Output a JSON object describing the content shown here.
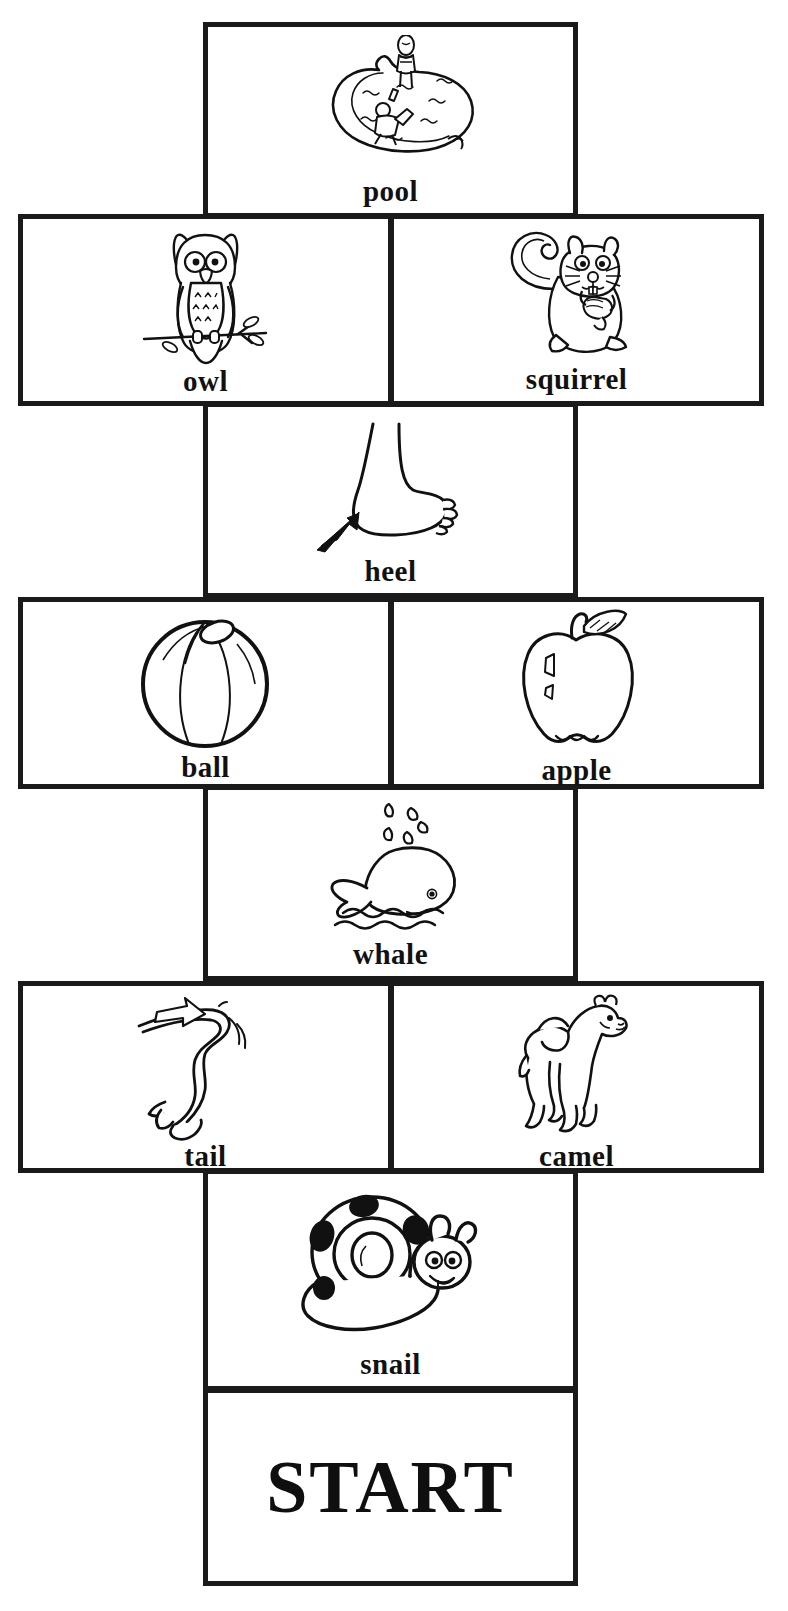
{
  "document": {
    "type": "board-game-path",
    "title_cut_off_top": "",
    "start_label": "START"
  },
  "path": {
    "direction": "bottom-to-top",
    "rows": [
      {
        "row_index": 0,
        "kind": "narrow",
        "cells": [
          {
            "label": "pool",
            "icon": "pool-icon"
          }
        ]
      },
      {
        "row_index": 1,
        "kind": "wide",
        "cells": [
          {
            "label": "owl",
            "icon": "owl-icon"
          },
          {
            "label": "squirrel",
            "icon": "squirrel-icon"
          }
        ]
      },
      {
        "row_index": 2,
        "kind": "narrow",
        "cells": [
          {
            "label": "heel",
            "icon": "heel-icon"
          }
        ]
      },
      {
        "row_index": 3,
        "kind": "wide",
        "cells": [
          {
            "label": "ball",
            "icon": "ball-icon"
          },
          {
            "label": "apple",
            "icon": "apple-icon"
          }
        ]
      },
      {
        "row_index": 4,
        "kind": "narrow",
        "cells": [
          {
            "label": "whale",
            "icon": "whale-icon"
          }
        ]
      },
      {
        "row_index": 5,
        "kind": "wide",
        "cells": [
          {
            "label": "tail",
            "icon": "tail-icon"
          },
          {
            "label": "camel",
            "icon": "camel-icon"
          }
        ]
      },
      {
        "row_index": 6,
        "kind": "narrow",
        "cells": [
          {
            "label": "snail",
            "icon": "snail-icon"
          }
        ]
      },
      {
        "row_index": 7,
        "kind": "narrow-start",
        "cells": [
          {
            "label": "START",
            "icon": ""
          }
        ]
      }
    ]
  },
  "colors": {
    "ink": "#1a1a1a",
    "paper": "#ffffff"
  }
}
